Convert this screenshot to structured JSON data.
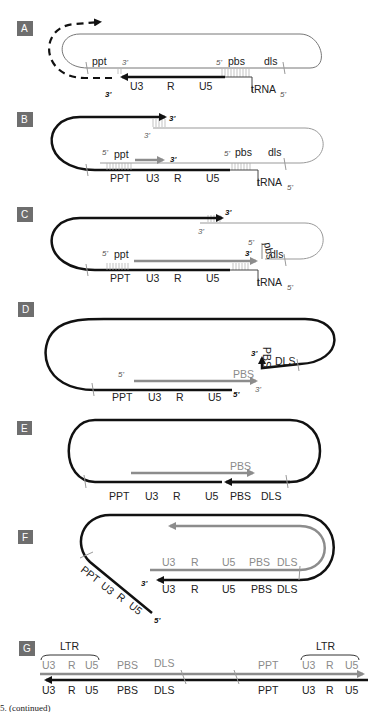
{
  "figure": {
    "caption": "5. (continued)",
    "colors": {
      "black_strand": "#111111",
      "gray_strand": "#8c8c8c",
      "thin_rna": "#9a9a9a",
      "panel_badge": "#6e6e6e"
    }
  },
  "panels": {
    "A": {
      "letter": "A",
      "upper": {
        "ppt": "ppt",
        "three_prime": "3'",
        "five_prime": "5'",
        "pbs": "pbs",
        "dls": "dls"
      },
      "lower": {
        "u3": "U3",
        "r": "R",
        "u5": "U5",
        "three_prime": "3'",
        "trna": "tRNA",
        "trna_end": "5'"
      }
    },
    "B": {
      "letter": "B",
      "top_end": "3'",
      "rna_end": "3'",
      "upper": {
        "five_prime_ppt": "5'",
        "ppt": "ppt",
        "arrow_end": "3'",
        "five_prime_pbs": "5'",
        "pbs": "pbs",
        "dls": "dls"
      },
      "lower": {
        "ppt": "PPT",
        "u3": "U3",
        "r": "R",
        "u5": "U5",
        "trna": "tRNA",
        "trna_end": "5'"
      }
    },
    "C": {
      "letter": "C",
      "top_end": "3'",
      "rna_end": "3'",
      "upper": {
        "five_prime_ppt": "5'",
        "ppt": "ppt",
        "five_prime_pbs": "5'",
        "pbs": "pbs",
        "arrow_end": "3'",
        "dls": "dls"
      },
      "lower": {
        "ppt": "PPT",
        "u3": "U3",
        "r": "R",
        "u5": "U5",
        "trna": "tRNA",
        "trna_end": "5'"
      }
    },
    "D": {
      "letter": "D",
      "hook_end": "3'",
      "hook_pbs": "PBS",
      "hook_dls": "DLS",
      "gray": {
        "five_prime": "5'",
        "pbs": "PBS",
        "three_prime": "3'"
      },
      "lower": {
        "ppt": "PPT",
        "u3": "U3",
        "r": "R",
        "u5": "U5",
        "five_prime": "5'"
      }
    },
    "E": {
      "letter": "E",
      "gray": {
        "pbs": "PBS"
      },
      "lower": {
        "ppt": "PPT",
        "u3": "U3",
        "r": "R",
        "u5": "U5",
        "pbs": "PBS",
        "dls": "DLS"
      }
    },
    "F": {
      "letter": "F",
      "gray_labels": [
        "U3",
        "R",
        "U5",
        "PBS",
        "DLS"
      ],
      "black_labels": [
        "U3",
        "R",
        "U5",
        "PBS",
        "DLS"
      ],
      "three_prime": "3'",
      "tail_labels": [
        "PPT",
        "U3",
        "R",
        "U5"
      ],
      "tail_end": "5'"
    },
    "G": {
      "letter": "G",
      "ltr_left": "LTR",
      "ltr_right": "LTR",
      "gray_labels_left": [
        "U3",
        "R",
        "U5",
        "PBS",
        "DLS"
      ],
      "gray_labels_right": [
        "PPT",
        "U3",
        "R",
        "U5"
      ],
      "black_labels_left": [
        "U3",
        "R",
        "U5",
        "PBS",
        "DLS"
      ],
      "black_labels_right": [
        "PPT",
        "U3",
        "R",
        "U5"
      ]
    }
  }
}
